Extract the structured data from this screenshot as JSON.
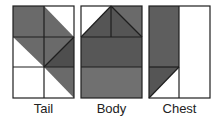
{
  "colors": {
    "outline": "#1e1e1e",
    "white": "#ffffff",
    "medium": "#707070",
    "dark": "#555555",
    "darkest": "#4a4a4a"
  },
  "blocks": [
    {
      "id": "tail",
      "label": "Tail",
      "x": 13,
      "y": 6,
      "w": 61,
      "h": 92,
      "cols": 2,
      "rows": 3
    },
    {
      "id": "body",
      "label": "Body",
      "x": 81,
      "y": 6,
      "w": 61,
      "h": 92
    },
    {
      "id": "chest",
      "label": "Chest",
      "x": 149,
      "y": 6,
      "w": 61,
      "h": 92,
      "cols": 2,
      "rows": 2
    }
  ]
}
